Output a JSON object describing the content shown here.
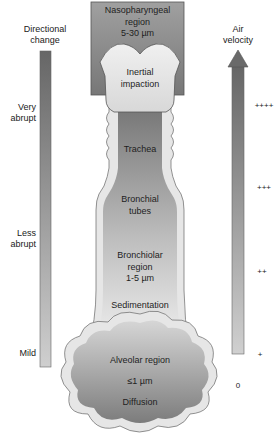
{
  "left_scale": {
    "title_line1": "Directional",
    "title_line2": "change",
    "levels": [
      {
        "line1": "Very",
        "line2": "abrupt"
      },
      {
        "line1": "Less",
        "line2": "abrupt"
      },
      {
        "line1": "Mild",
        "line2": ""
      }
    ]
  },
  "right_scale": {
    "title_line1": "Air",
    "title_line2": "velocity",
    "levels": [
      "++++",
      "+++",
      "++",
      "+",
      "0"
    ]
  },
  "regions": {
    "nasopharyngeal": {
      "line1": "Nasopharyngeal",
      "line2": "region",
      "line3": "5-30 µm"
    },
    "inertial": {
      "line1": "Inertial",
      "line2": "impaction"
    },
    "trachea": "Trachea",
    "bronchial": {
      "line1": "Bronchial",
      "line2": "tubes"
    },
    "bronchiolar": {
      "line1": "Bronchiolar",
      "line2": "region",
      "line3": "1-5 µm"
    },
    "sedimentation": "Sedimentation",
    "alveolar": {
      "line1": "Alveolar region",
      "line2": "≤1 µm",
      "line3": "Diffusion"
    }
  },
  "colors": {
    "bar_dark": "#6b6b6b",
    "bar_light": "#c9c9c9",
    "box_top": "#9a9a9a",
    "box_bottom": "#7a7a7a",
    "pale": "#e4e4e4",
    "outline": "#555555"
  }
}
